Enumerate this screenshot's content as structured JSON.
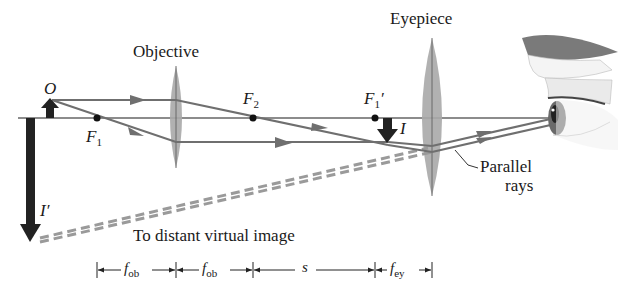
{
  "labels": {
    "objective": "Objective",
    "eyepiece": "Eyepiece",
    "object": "O",
    "f1": "F",
    "f1_sub": "1",
    "f2": "F",
    "f2_sub": "2",
    "f1prime": "F",
    "f1prime_sub": "1",
    "f1prime_mark": "′",
    "image": "I",
    "final_image": "I′",
    "parallel_rays_line1": "Parallel",
    "parallel_rays_line2": "rays",
    "virtual_image": "To distant virtual image"
  },
  "dimensions": {
    "f_ob_1": "f",
    "f_ob_1_sub": "ob",
    "f_ob_2": "f",
    "f_ob_2_sub": "ob",
    "s": "s",
    "f_ey": "f",
    "f_ey_sub": "ey"
  },
  "colors": {
    "axis": "#1a1a1a",
    "ray": "#6f6f6f",
    "lens": "#a8a8a8",
    "arrow": "#222222",
    "dashed": "#9a9a9a"
  }
}
